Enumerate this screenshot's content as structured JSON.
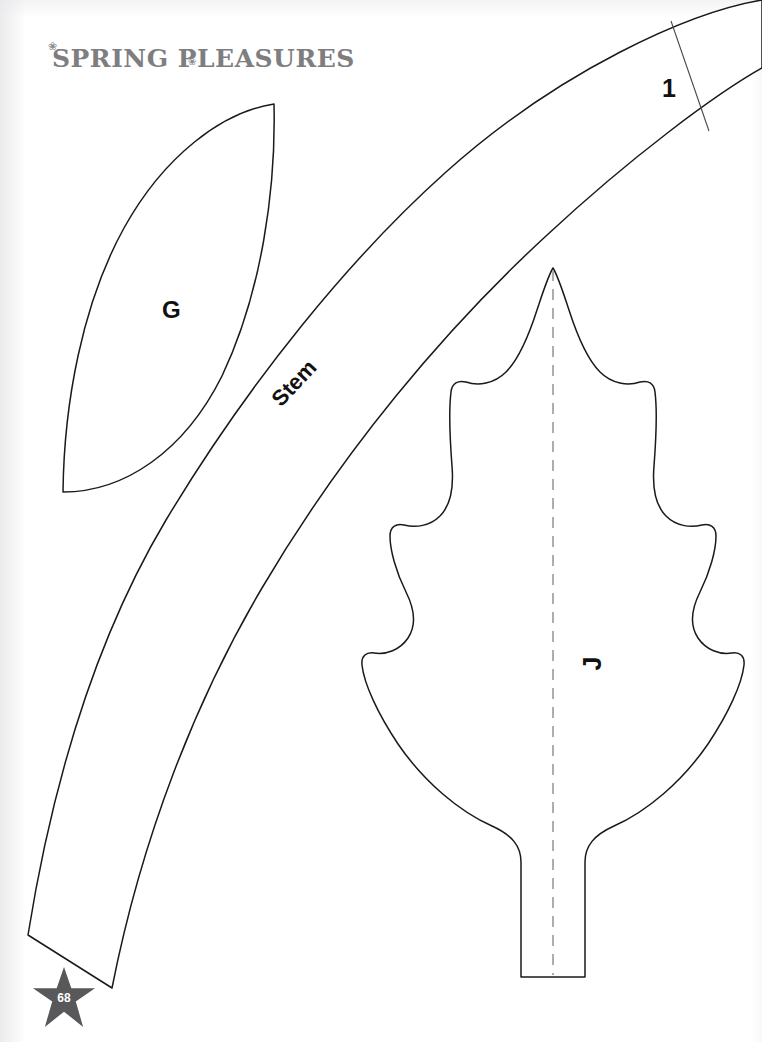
{
  "page": {
    "kind": "craft-pattern-template-page",
    "background_color": "#ffffff",
    "width": 762,
    "height": 1042,
    "page_number": "68",
    "star_color": "#58585a",
    "star_number_color": "#ffffff"
  },
  "header": {
    "title": "Spring Pleasures",
    "title_part_1": "Spring",
    "title_part_2": "Pleasures",
    "title_color": "#7e7e80",
    "flourish_left": "❀",
    "flourish_mid": "❀"
  },
  "labels": {
    "leaf_g": "G",
    "leaf_j": "J",
    "stem": "Stem",
    "stem_mark": "1"
  },
  "shapes": {
    "stroke_color": "#1a1a1a",
    "stroke_width": 1.5,
    "fold_line_color": "#9a9a9a",
    "fold_line_dash": "11 8",
    "items": [
      {
        "name": "pointed-oval-leaf",
        "label": "G",
        "description": "pointed oval (lens) leaf template, upper left",
        "top_tip": [
          274,
          104
        ],
        "bottom_tip": [
          63,
          492
        ]
      },
      {
        "name": "curved-stem",
        "label": "Stem",
        "description": "long curved tapering stem band running from lower left to upper right off-page",
        "cut_mark": "1",
        "bottom_left": [
          28,
          935
        ],
        "bottom_right": [
          112,
          988
        ]
      },
      {
        "name": "oak-leaf",
        "label": "J",
        "description": "lobed oak leaf with dashed center fold line and straight petiole",
        "tip": [
          553,
          268
        ],
        "petiole_bottom": [
          553,
          977
        ]
      },
      {
        "name": "cut-line",
        "description": "thin diagonal registration/cut line crossing the stem near label 1",
        "from": [
          671,
          21
        ],
        "to": [
          709,
          131
        ]
      },
      {
        "name": "fold-line",
        "description": "gray dashed vertical fold line down the oak leaf center",
        "from": [
          553,
          270
        ],
        "to": [
          553,
          975
        ]
      }
    ]
  }
}
